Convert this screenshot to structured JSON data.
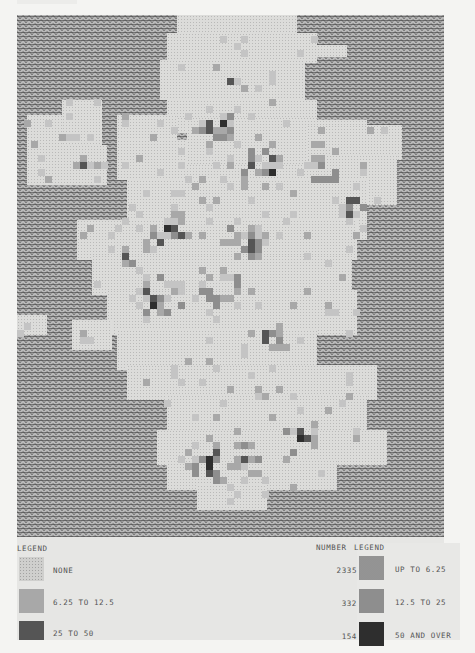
{
  "map": {
    "subject": "Scotland grid choropleth",
    "sea_pattern": "wave",
    "land_base_color": "#dcdcda",
    "class_colors": {
      "none": "#cfcfcd",
      "up_to_6_25": "#c4c4c4",
      "6_25_to_12_5": "#a8a8a8",
      "12_5_to_25": "#8e8e8e",
      "25_to_50": "#555555",
      "50_and_over": "#2e2e2e"
    }
  },
  "legend": {
    "left_title": "LEGEND",
    "number_header": "NUMBER",
    "right_title": "LEGEND",
    "rows": [
      {
        "left_label": "NONE",
        "number": "2335",
        "right_label": "UP TO 6.25"
      },
      {
        "left_label": "6.25 TO 12.5",
        "number": "332",
        "right_label": "12.5 TO 25"
      },
      {
        "left_label": "25 TO 50",
        "number": "154",
        "right_label": "50 AND OVER"
      }
    ]
  },
  "chart_data": {
    "type": "heatmap",
    "title": "",
    "legend_entries": [
      {
        "label": "NONE",
        "count": 2335
      },
      {
        "label": "UP TO 6.25",
        "count": null
      },
      {
        "label": "6.25 TO 12.5",
        "count": 332
      },
      {
        "label": "12.5 TO 25",
        "count": null
      },
      {
        "label": "25 TO 50",
        "count": 154
      },
      {
        "label": "50 AND OVER",
        "count": null
      }
    ],
    "number_column": [
      2335,
      332,
      154
    ],
    "grid_on": false,
    "legend_position": "bottom"
  }
}
